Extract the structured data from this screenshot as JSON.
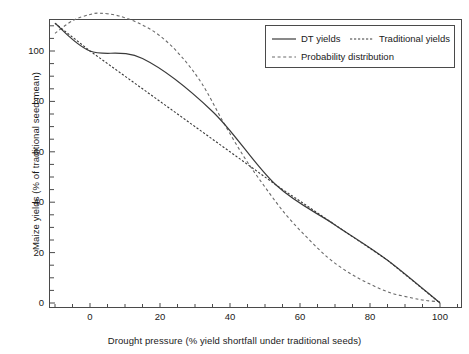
{
  "chart_data": {
    "type": "line",
    "title": "",
    "xlabel": "Drought pressure (% yield shortfall under traditional seeds)",
    "ylabel": "Maize yields (% of traditional seed mean)",
    "xlim": [
      -10,
      103
    ],
    "ylim": [
      -2,
      118
    ],
    "xticks": [
      0,
      20,
      40,
      60,
      80,
      100
    ],
    "yticks": [
      0,
      20,
      40,
      60,
      80,
      100
    ],
    "xtick_labels": [
      "0",
      "20",
      "40",
      "60",
      "80",
      "100"
    ],
    "ytick_labels": [
      "0",
      "20",
      "40",
      "60",
      "80",
      "100"
    ],
    "grid": false,
    "legend_position": "top-right",
    "series": [
      {
        "name": "DT yields",
        "style": "solid",
        "color": "#3a3a3a",
        "points": [
          [
            -10,
            111
          ],
          [
            0,
            100
          ],
          [
            15,
            97
          ],
          [
            35,
            76
          ],
          [
            53,
            47
          ],
          [
            70,
            31
          ],
          [
            85,
            17
          ],
          [
            100,
            0
          ]
        ]
      },
      {
        "name": "Traditional yields",
        "style": "dashed",
        "color": "#3a3a3a",
        "points": [
          [
            -10,
            111
          ],
          [
            0,
            100
          ],
          [
            20,
            80
          ],
          [
            40,
            60
          ],
          [
            53,
            47
          ],
          [
            70,
            31
          ],
          [
            85,
            17
          ],
          [
            100,
            0
          ]
        ]
      },
      {
        "name": "Probability distribution",
        "style": "dashed",
        "color": "#6a6a6a",
        "points": [
          [
            -10,
            107
          ],
          [
            -5,
            112
          ],
          [
            0,
            114.5
          ],
          [
            3,
            115
          ],
          [
            8,
            114
          ],
          [
            14,
            111
          ],
          [
            20,
            106
          ],
          [
            26,
            98
          ],
          [
            32,
            87
          ],
          [
            38,
            72
          ],
          [
            44,
            58
          ],
          [
            50,
            46
          ],
          [
            56,
            35
          ],
          [
            62,
            26
          ],
          [
            68,
            18
          ],
          [
            74,
            12
          ],
          [
            80,
            7.5
          ],
          [
            86,
            4
          ],
          [
            92,
            2
          ],
          [
            96,
            1
          ],
          [
            100,
            0.5
          ]
        ]
      }
    ],
    "legend": [
      {
        "label": "DT yields",
        "style": "solid"
      },
      {
        "label": "Traditional yields",
        "style": "dashed"
      },
      {
        "label": "Probability distribution",
        "style": "dashed"
      }
    ]
  }
}
